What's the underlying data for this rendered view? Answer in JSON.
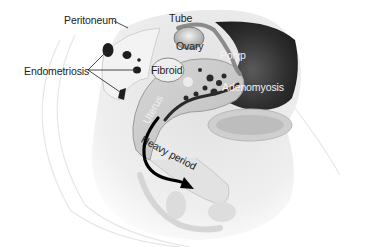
{
  "diagram": {
    "labels": {
      "peritoneum": "Peritoneum",
      "tube": "Tube",
      "ovary": "Ovary",
      "polyp": "Polyp",
      "endometriosis": "Endometriosis",
      "fibroid": "Fibroid",
      "adenomyosis": "Adenomyosis",
      "uterus": "Uterus",
      "heavy_period": "Heavy period"
    },
    "colors": {
      "background": "#ffffff",
      "tissue_light": "#e9e9e9",
      "tissue_mid": "#bdbdbd",
      "cavity_dark": "#3a3a3a",
      "lesion": "#1e1e1e",
      "arrow": "#000000",
      "label_dark": "#222222",
      "label_light": "#f2f2f2"
    }
  }
}
